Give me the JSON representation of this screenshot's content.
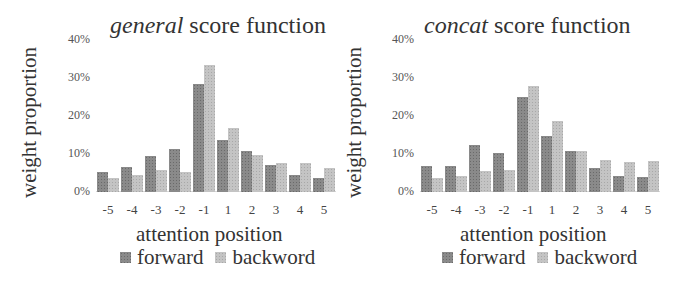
{
  "chart_data": [
    {
      "type": "bar",
      "title_italic": "general",
      "title_rest": " score function",
      "title": "general score function",
      "xlabel": "attention position",
      "ylabel": "weight proportion",
      "ylim": [
        0,
        40
      ],
      "yticks": [
        "40%",
        "30%",
        "20%",
        "10%",
        "0%"
      ],
      "categories": [
        "-5",
        "-4",
        "-3",
        "-2",
        "-1",
        "1",
        "2",
        "3",
        "4",
        "5"
      ],
      "series": [
        {
          "name": "forward",
          "values": [
            5.3,
            6.6,
            9.5,
            11.3,
            28.4,
            13.7,
            10.8,
            7.1,
            4.5,
            3.7
          ]
        },
        {
          "name": "backword",
          "values": [
            3.7,
            4.5,
            5.8,
            5.3,
            33.4,
            16.8,
            9.7,
            7.6,
            7.6,
            6.3
          ]
        }
      ],
      "legend": [
        "forward",
        "backword"
      ],
      "legend_position": "bottom",
      "grid": false
    },
    {
      "type": "bar",
      "title_italic": "concat",
      "title_rest": " score function",
      "title": "concat score function",
      "xlabel": "attention position",
      "ylabel": "weight proportion",
      "ylim": [
        0,
        40
      ],
      "yticks": [
        "40%",
        "30%",
        "20%",
        "10%",
        "0%"
      ],
      "categories": [
        "-5",
        "-4",
        "-3",
        "-2",
        "-1",
        "1",
        "2",
        "3",
        "4",
        "5"
      ],
      "series": [
        {
          "name": "forward",
          "values": [
            6.8,
            6.8,
            12.4,
            10.3,
            25.0,
            14.8,
            10.8,
            6.3,
            4.2,
            4.0
          ]
        },
        {
          "name": "backword",
          "values": [
            3.7,
            4.2,
            5.5,
            5.8,
            28.0,
            18.7,
            10.8,
            8.4,
            7.9,
            8.1
          ]
        }
      ],
      "legend": [
        "forward",
        "backword"
      ],
      "legend_position": "bottom",
      "grid": false
    }
  ],
  "colors": {
    "forward": "#7a7a7a",
    "backword": "#bdbdbd"
  }
}
